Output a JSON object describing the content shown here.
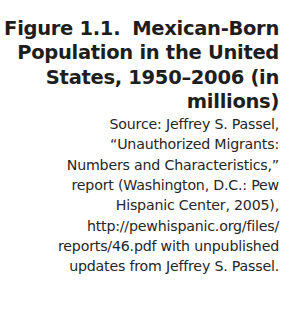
{
  "figure": {
    "number": "Figure 1.1.",
    "title_lines": [
      "Mexican-Born",
      "Population in the United",
      "States, 1950–2006 (in",
      "millions)"
    ],
    "source_lines": [
      "Source: Jeffrey S. Passel,",
      "“Unauthorized Migrants:",
      "Numbers and Characteristics,”",
      "report (Washington, D.C.: Pew",
      "Hispanic Center, 2005),",
      "http://pewhispanic.org/files/",
      "reports/46.pdf with unpublished",
      "updates from Jeffrey S. Passel."
    ]
  }
}
